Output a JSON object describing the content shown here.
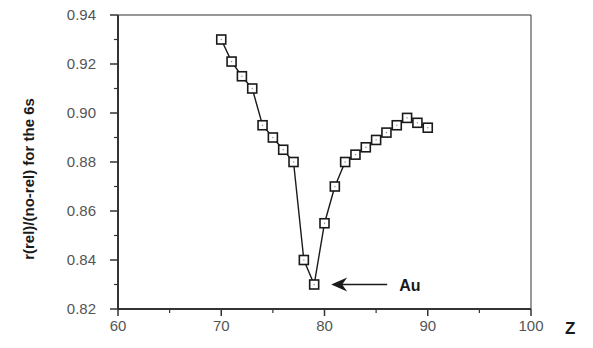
{
  "chart_data": {
    "type": "line",
    "title": "",
    "xlabel": "Z",
    "ylabel": "r(rel)/(no-rel) for the 6s",
    "xlim": [
      60,
      100
    ],
    "ylim": [
      0.82,
      0.94
    ],
    "xticks": [
      60,
      70,
      80,
      90,
      100
    ],
    "xtick_labels": [
      "60",
      "70",
      "80",
      "90",
      "100"
    ],
    "yticks": [
      0.82,
      0.84,
      0.86,
      0.88,
      0.9,
      0.92,
      0.94
    ],
    "ytick_labels": [
      "0.82",
      "0.84",
      "0.86",
      "0.88",
      "0.90",
      "0.92",
      "0.94"
    ],
    "grid": false,
    "legend": null,
    "marker": "open-square",
    "series": [
      {
        "name": "6s contraction ratio",
        "x": [
          70,
          71,
          72,
          73,
          74,
          75,
          76,
          77,
          78,
          79,
          80,
          81,
          82,
          83,
          84,
          85,
          86,
          87,
          88,
          89,
          90
        ],
        "values": [
          0.93,
          0.921,
          0.915,
          0.91,
          0.895,
          0.89,
          0.885,
          0.88,
          0.84,
          0.83,
          0.855,
          0.87,
          0.88,
          0.883,
          0.886,
          0.889,
          0.892,
          0.895,
          0.898,
          0.896,
          0.894
        ]
      }
    ],
    "annotations": [
      {
        "text": "Au",
        "points_to": {
          "x": 79,
          "y": 0.83
        },
        "arrow": "left"
      }
    ],
    "colors": {
      "line": "#1a1a1a",
      "marker_fill": "#ffffff",
      "axis": "#333333",
      "tick_text": "#555555"
    }
  }
}
